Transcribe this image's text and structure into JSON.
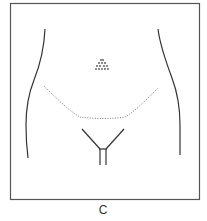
{
  "figure": {
    "panel_label": "C",
    "colors": {
      "frame": "#555555",
      "contour": "#333333",
      "incision": "#777777",
      "background": "#ffffff"
    },
    "elements": [
      {
        "name": "left-body-contour",
        "type": "solid-curve"
      },
      {
        "name": "right-body-contour",
        "type": "solid-curve"
      },
      {
        "name": "umbilicus-marker",
        "type": "dotted-triangle"
      },
      {
        "name": "incision-line",
        "type": "dotted-path"
      },
      {
        "name": "pubic-y-outline",
        "type": "solid-lines"
      }
    ]
  }
}
